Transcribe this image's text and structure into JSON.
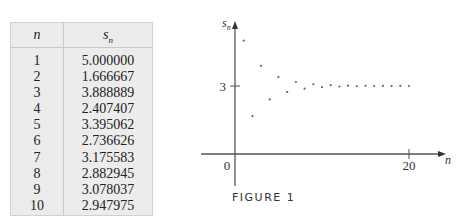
{
  "table": {
    "header_n": "n",
    "header_s": "s",
    "header_s_sub": "n",
    "rows": [
      {
        "n": "1",
        "s": "5.000000"
      },
      {
        "n": "2",
        "s": "1.666667"
      },
      {
        "n": "3",
        "s": "3.888889"
      },
      {
        "n": "4",
        "s": "2.407407"
      },
      {
        "n": "5",
        "s": "3.395062"
      },
      {
        "n": "6",
        "s": "2.736626"
      },
      {
        "n": "7",
        "s": "3.175583"
      },
      {
        "n": "8",
        "s": "2.882945"
      },
      {
        "n": "9",
        "s": "3.078037"
      },
      {
        "n": "10",
        "s": "2.947975"
      }
    ]
  },
  "caption": "FIGURE 1",
  "chart_data": {
    "type": "scatter",
    "title": "",
    "xlabel": "n",
    "ylabel": "s_n",
    "xlim": [
      0,
      22
    ],
    "ylim": [
      0,
      5.5
    ],
    "x_ticks": [
      {
        "value": 0,
        "label": "0"
      },
      {
        "value": 20,
        "label": "20"
      }
    ],
    "y_ticks": [
      {
        "value": 3,
        "label": "3"
      }
    ],
    "grid": false,
    "series": [
      {
        "name": "s_n",
        "x": [
          1,
          2,
          3,
          4,
          5,
          6,
          7,
          8,
          9,
          10,
          11,
          12,
          13,
          14,
          15,
          16,
          17,
          18,
          19,
          20
        ],
        "y": [
          5.0,
          1.666667,
          3.888889,
          2.407407,
          3.395062,
          2.736626,
          3.175583,
          2.882945,
          3.078037,
          2.947975,
          3.034683,
          2.976878,
          3.015415,
          2.989723,
          3.006851,
          2.995433,
          3.003045,
          2.99797,
          3.001353,
          2.999098
        ]
      }
    ]
  }
}
